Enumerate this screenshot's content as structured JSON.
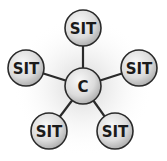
{
  "diagram": {
    "type": "hub-and-spoke",
    "center": {
      "label": "C"
    },
    "satellites": [
      {
        "label": "SIT",
        "position": "top"
      },
      {
        "label": "SIT",
        "position": "right"
      },
      {
        "label": "SIT",
        "position": "bottom-right"
      },
      {
        "label": "SIT",
        "position": "bottom-left"
      },
      {
        "label": "SIT",
        "position": "left"
      }
    ],
    "colors": {
      "node_fill_light": "#f4f4f4",
      "node_fill_dark": "#b8b8b8",
      "node_stroke": "#2a2a2a",
      "edge": "#2a2a2a",
      "glow": "#d0d0d0"
    }
  }
}
